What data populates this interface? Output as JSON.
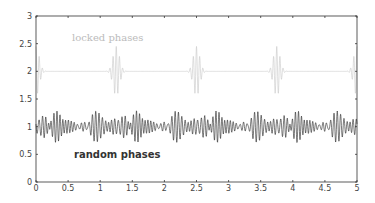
{
  "chart_data": {
    "type": "line",
    "title": "",
    "xlabel": "",
    "ylabel": "",
    "xlim": [
      0,
      5
    ],
    "ylim": [
      0,
      3
    ],
    "grid": false,
    "x_ticks": [
      "0",
      "0.5",
      "1",
      "1.5",
      "2",
      "2.5",
      "3",
      "3.5",
      "4",
      "4.5",
      "5"
    ],
    "y_ticks": [
      "0",
      "0.5",
      "1",
      "1.5",
      "2",
      "2.5",
      "3"
    ],
    "annotations": [
      {
        "text": "locked phases",
        "x": 0.6,
        "y": 2.6
      },
      {
        "text": "random phases",
        "x": 0.6,
        "y": 0.5
      }
    ],
    "series": [
      {
        "name": "locked phases",
        "color": "#c8c8c8",
        "offset": 2,
        "description": "Periodic wave packets centered at y=2, amplitude ~0.45",
        "packet_centers": [
          0,
          1.25,
          2.5,
          3.75,
          5
        ],
        "peak_amplitude": 0.45
      },
      {
        "name": "random phases",
        "color": "#222222",
        "offset": 1,
        "description": "Continuous irregular oscillation around y=1, amplitude ~0.3",
        "peak_amplitude": 0.3
      }
    ]
  }
}
